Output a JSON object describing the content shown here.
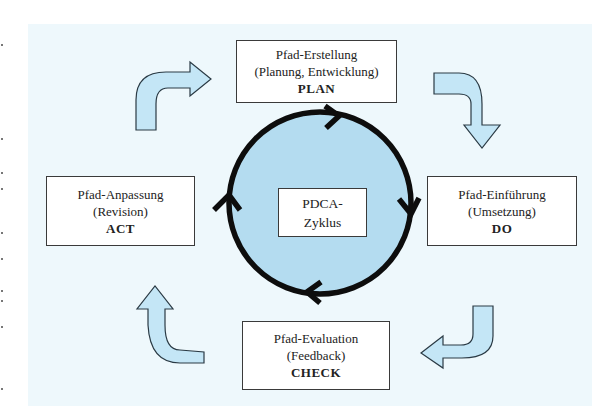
{
  "diagram": {
    "center": {
      "line1": "PDCA-",
      "line2": "Zyklus"
    },
    "stages": {
      "plan": {
        "title": "Pfad-Erstellung",
        "subtitle": "(Planung, Entwicklung)",
        "code": "PLAN"
      },
      "do": {
        "title": "Pfad-Einführung",
        "subtitle": "(Umsetzung)",
        "code": "DO"
      },
      "check": {
        "title": "Pfad-Evaluation",
        "subtitle": "(Feedback)",
        "code": "CHECK"
      },
      "act": {
        "title": "Pfad-Anpassung",
        "subtitle": "(Revision)",
        "code": "ACT"
      }
    },
    "flow": [
      "PLAN",
      "DO",
      "CHECK",
      "ACT"
    ],
    "colors": {
      "background": "#eef8fc",
      "arrow_fill": "#c4e6f6",
      "circle_fill": "#b4dcf0",
      "outline": "#222222"
    }
  }
}
